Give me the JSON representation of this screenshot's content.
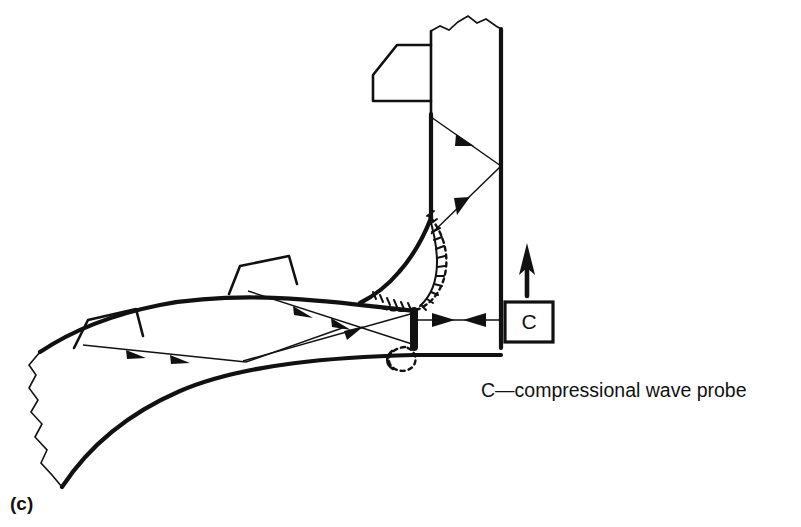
{
  "figure": {
    "panel_label": "(c)",
    "legend": "C—compressional wave probe",
    "probe_label": "C",
    "background_color": "#ffffff",
    "ink_color": "#111111",
    "title_semantic": "ultrasonic-inspection-of-t-butt-weld-with-compressional-wave-probe"
  },
  "components": {
    "vertical_member_name": "vertical-plate",
    "curved_member_name": "curved-branch-plate",
    "weld_zone_name": "weld-fusion-zone",
    "root_bead_name": "weld-root-bead",
    "probe_name": "compressional-wave-probe-C",
    "scan_arrow_name": "probe-scan-direction-arrow"
  },
  "attachments": [
    {
      "name": "probe-shoe-upper-left",
      "position": "vertical-plate-left-face"
    },
    {
      "name": "probe-shoe-mid",
      "position": "curved-plate-upper-face"
    },
    {
      "name": "probe-shoe-lower-left",
      "position": "curved-plate-upper-face"
    }
  ],
  "rays": [
    {
      "name": "ray-upper-down-right",
      "arrowheads": 1,
      "direction": "down-right"
    },
    {
      "name": "ray-upper-reflected-up-right",
      "arrowheads": 1,
      "direction": "up-right"
    },
    {
      "name": "ray-mid-down-right",
      "arrowheads": 2,
      "direction": "down-right"
    },
    {
      "name": "ray-lower-right-to-left",
      "arrowheads": 2,
      "direction": "right"
    },
    {
      "name": "ray-lower-up-right",
      "arrowheads": 1,
      "direction": "up-right"
    },
    {
      "name": "ray-probe-horizontal",
      "arrowheads": 2,
      "direction": "bidirectional"
    }
  ]
}
